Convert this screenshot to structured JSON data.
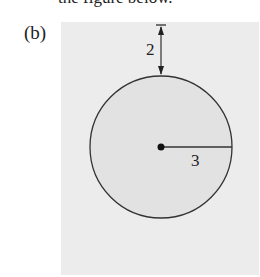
{
  "top_text": "the figure below.",
  "part_label": "(b)",
  "figure": {
    "shape": "circle",
    "gap_label": "2",
    "radius_label": "3",
    "colors": {
      "panel": "#ececec",
      "circle_fill": "#e2e2e2",
      "stroke": "#333333"
    }
  }
}
